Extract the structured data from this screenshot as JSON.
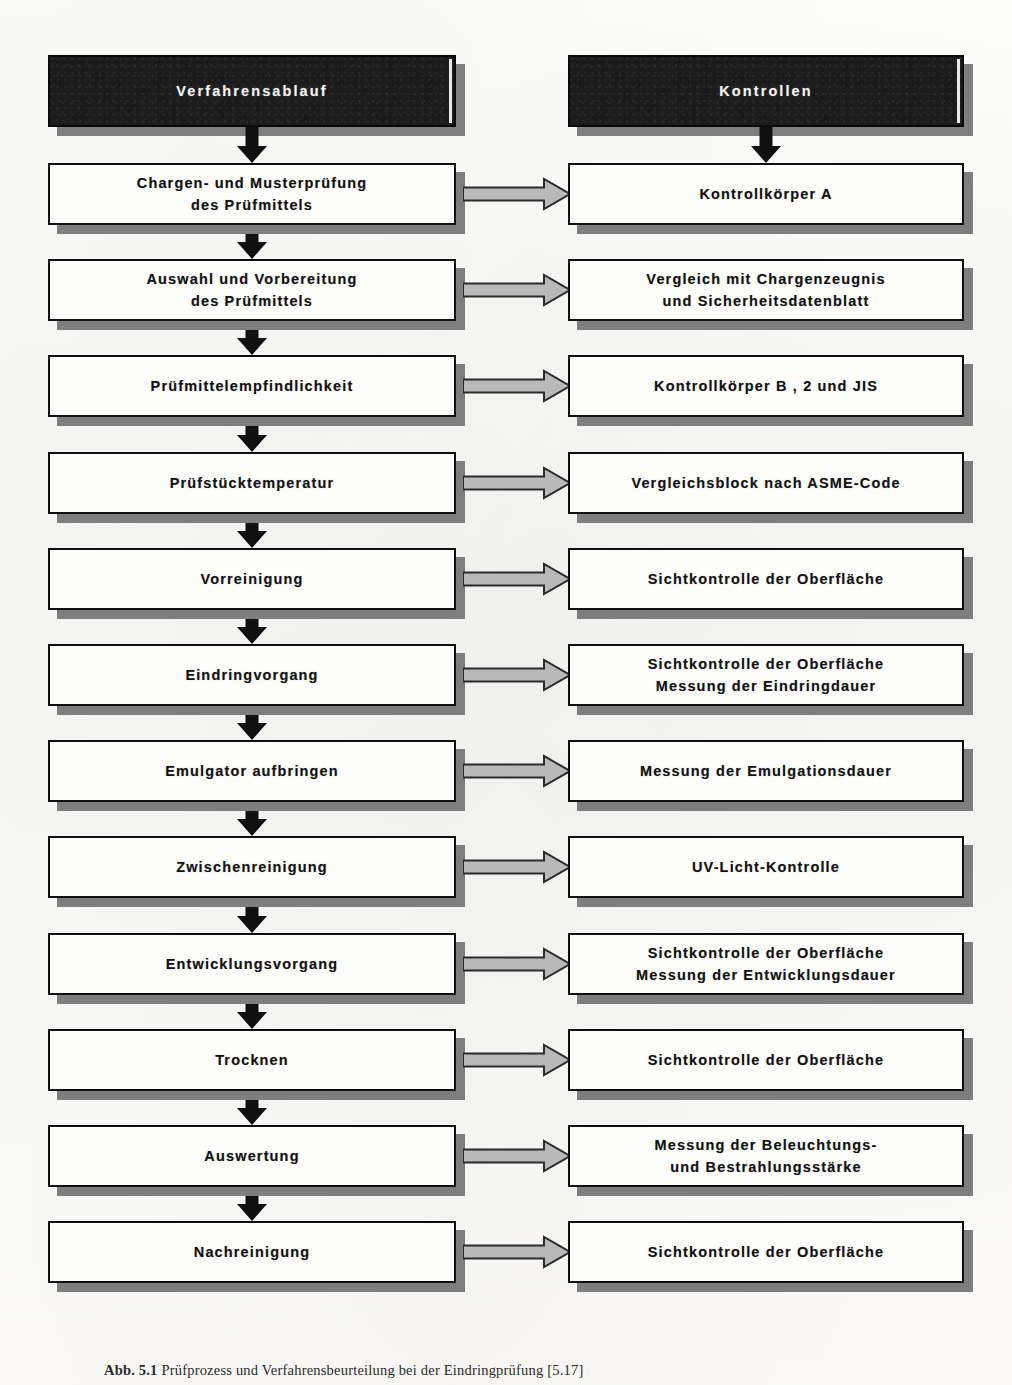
{
  "figure": {
    "caption_number": "Abb. 5.1",
    "caption_text": "Prüfprozess und Verfahrensbeurteilung bei der Eindringprüfung [5.17]"
  },
  "colors": {
    "box_fill": "#fdfdfc",
    "box_border": "#101010",
    "header_fill": "#1b1b1b",
    "header_text": "#f4f4f4",
    "shadow": "#7e7e7e",
    "flow_arrow": "#101010",
    "link_arrow_fill": "#b9b9b9",
    "link_arrow_stroke": "#2b2b2b",
    "page_background": "#fbfbfa"
  },
  "columns": {
    "left": {
      "header": "Verfahrensablauf",
      "header_icon": "column-header-banner"
    },
    "right": {
      "header": "Kontrollen",
      "header_icon": "column-header-banner"
    }
  },
  "rows": [
    {
      "step": "Chargen- und Musterprüfung\ndes  Prüfmittels",
      "control": "Kontrollkörper A"
    },
    {
      "step": "Auswahl und Vorbereitung\ndes Prüfmittels",
      "control": "Vergleich mit Chargenzeugnis\nund Sicherheitsdatenblatt"
    },
    {
      "step": "Prüfmittelempfindlichkeit",
      "control": "Kontrollkörper B , 2 und  JIS"
    },
    {
      "step": "Prüfstücktemperatur",
      "control": "Vergleichsblock nach ASME-Code"
    },
    {
      "step": "Vorreinigung",
      "control": "Sichtkontrolle der Oberfläche"
    },
    {
      "step": "Eindringvorgang",
      "control": "Sichtkontrolle der Oberfläche\nMessung der Eindringdauer"
    },
    {
      "step": "Emulgator aufbringen",
      "control": "Messung der Emulgationsdauer"
    },
    {
      "step": "Zwischenreinigung",
      "control": "UV-Licht-Kontrolle"
    },
    {
      "step": "Entwicklungsvorgang",
      "control": "Sichtkontrolle der Oberfläche\nMessung der Entwicklungsdauer"
    },
    {
      "step": "Trocknen",
      "control": "Sichtkontrolle der Oberfläche"
    },
    {
      "step": "Auswertung",
      "control": "Messung der Beleuchtungs-\nund Bestrahlungsstärke"
    },
    {
      "step": "Nachreinigung",
      "control": "Sichtkontrolle der Oberfläche"
    }
  ]
}
